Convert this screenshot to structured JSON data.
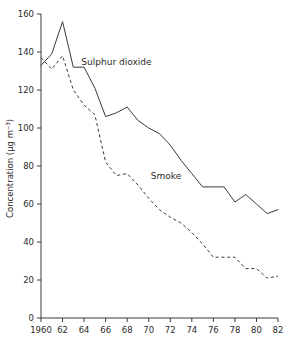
{
  "chart_data": {
    "type": "line",
    "title": "",
    "xlabel": "",
    "ylabel": "Concentration (µg m⁻³)",
    "xlim": [
      1960,
      1982
    ],
    "ylim": [
      0,
      160
    ],
    "grid": false,
    "legend_position": "inline-annotation",
    "x_tick_labels": [
      "1960",
      "62",
      "64",
      "66",
      "68",
      "70",
      "72",
      "74",
      "76",
      "78",
      "80",
      "82"
    ],
    "x_tick_values": [
      1960,
      1962,
      1964,
      1966,
      1968,
      1970,
      1972,
      1974,
      1976,
      1978,
      1980,
      1982
    ],
    "y_tick_labels": [
      "0",
      "20",
      "40",
      "60",
      "80",
      "100",
      "120",
      "140",
      "160"
    ],
    "y_tick_values": [
      0,
      20,
      40,
      60,
      80,
      100,
      120,
      140,
      160
    ],
    "x": [
      1960,
      1961,
      1962,
      1963,
      1964,
      1965,
      1966,
      1967,
      1968,
      1969,
      1970,
      1971,
      1972,
      1973,
      1974,
      1975,
      1976,
      1977,
      1978,
      1979,
      1980,
      1981,
      1982
    ],
    "series": [
      {
        "name": "Sulphur dioxide",
        "style": "solid",
        "label_x": 1967.0,
        "label_y": 133,
        "values": [
          133,
          139,
          156,
          132,
          132,
          121,
          106,
          108,
          111,
          104,
          100,
          97,
          91,
          83,
          76,
          69,
          69,
          69,
          61,
          65,
          60,
          55,
          57
        ]
      },
      {
        "name": "Smoke",
        "style": "dashed",
        "label_x": 1971.6,
        "label_y": 73,
        "values": [
          137,
          131,
          138,
          120,
          112,
          107,
          82,
          75,
          76,
          70,
          63,
          57,
          53,
          50,
          45,
          39,
          32,
          32,
          32,
          26,
          26,
          21,
          22
        ]
      }
    ]
  }
}
